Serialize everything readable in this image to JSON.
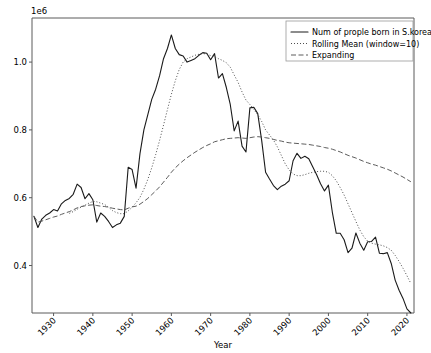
{
  "chart_data": {
    "type": "line",
    "title": "",
    "xlabel": "Year",
    "ylabel": "",
    "y_offset_text": "1e6",
    "xlim": [
      1924.5,
      2021.8
    ],
    "ylim": [
      260000,
      1130000
    ],
    "grid": false,
    "legend_position": "upper right",
    "xticks": [
      1930,
      1940,
      1950,
      1960,
      1970,
      1980,
      1990,
      2000,
      2010,
      2020
    ],
    "xtick_labels": [
      "1930",
      "1940",
      "1950",
      "1960",
      "1970",
      "1980",
      "1990",
      "2000",
      "2010",
      "2020"
    ],
    "xtick_rotation": 45,
    "yticks": [
      400000,
      600000,
      800000,
      1000000
    ],
    "ytick_labels": [
      "0.4",
      "0.6",
      "0.8",
      "1.0"
    ],
    "x": [
      1925,
      1926,
      1927,
      1928,
      1929,
      1930,
      1931,
      1932,
      1933,
      1934,
      1935,
      1936,
      1937,
      1938,
      1939,
      1940,
      1941,
      1942,
      1943,
      1944,
      1945,
      1946,
      1947,
      1948,
      1949,
      1950,
      1951,
      1952,
      1953,
      1954,
      1955,
      1956,
      1957,
      1958,
      1959,
      1960,
      1961,
      1962,
      1963,
      1964,
      1965,
      1966,
      1967,
      1968,
      1969,
      1970,
      1971,
      1972,
      1973,
      1974,
      1975,
      1976,
      1977,
      1978,
      1979,
      1980,
      1981,
      1982,
      1983,
      1984,
      1985,
      1986,
      1987,
      1988,
      1989,
      1990,
      1991,
      1992,
      1993,
      1994,
      1995,
      1996,
      1997,
      1998,
      1999,
      2000,
      2001,
      2002,
      2003,
      2004,
      2005,
      2006,
      2007,
      2008,
      2009,
      2010,
      2011,
      2012,
      2013,
      2014,
      2015,
      2016,
      2017,
      2018,
      2019,
      2020,
      2021
    ],
    "series": [
      {
        "name": "Num of prople born in S.korea",
        "style": "solid",
        "color": "#1a1a1a",
        "values": [
          545000,
          512000,
          537000,
          548000,
          555000,
          565000,
          561000,
          582000,
          592000,
          598000,
          610000,
          640000,
          630000,
          597000,
          612000,
          594000,
          528000,
          555000,
          545000,
          530000,
          512000,
          520000,
          525000,
          545000,
          690000,
          683000,
          628000,
          730000,
          800000,
          845000,
          890000,
          920000,
          960000,
          1010000,
          1040000,
          1080000,
          1040000,
          1022000,
          1018000,
          1000000,
          1005000,
          1010000,
          1020000,
          1028000,
          1026000,
          1007000,
          1025000,
          953000,
          966000,
          925000,
          875000,
          797000,
          826000,
          752000,
          735000,
          865000,
          867000,
          848000,
          769000,
          675000,
          655000,
          636000,
          624000,
          634000,
          640000,
          650000,
          709000,
          731000,
          716000,
          722000,
          715000,
          691000,
          668000,
          641000,
          620000,
          637000,
          557000,
          495000,
          495000,
          476000,
          438000,
          451000,
          496000,
          466000,
          445000,
          470000,
          471000,
          484000,
          436000,
          435000,
          438000,
          406000,
          357000,
          327000,
          303000,
          272000,
          260000
        ]
      },
      {
        "name": "Rolling Mean (window=10)",
        "style": "dotted",
        "color": "#3a3a3a",
        "values": [
          null,
          null,
          null,
          null,
          null,
          null,
          null,
          null,
          null,
          554000,
          559000,
          566000,
          572000,
          578000,
          584000,
          589000,
          588000,
          584000,
          580000,
          572000,
          562000,
          556000,
          553000,
          553000,
          561000,
          572000,
          585000,
          601000,
          625000,
          654000,
          688000,
          727000,
          769000,
          814000,
          860000,
          905000,
          945000,
          978000,
          1000000,
          1010000,
          1015000,
          1020000,
          1023000,
          1025000,
          1024000,
          1019000,
          1016000,
          1010000,
          1005000,
          998000,
          985000,
          962000,
          940000,
          912000,
          888000,
          875000,
          860000,
          845000,
          825000,
          800000,
          785000,
          770000,
          750000,
          725000,
          700000,
          682000,
          670000,
          665000,
          665000,
          668000,
          672000,
          675000,
          677000,
          678000,
          678000,
          675000,
          665000,
          650000,
          630000,
          608000,
          582000,
          556000,
          530000,
          505000,
          485000,
          472000,
          466000,
          463000,
          461000,
          458000,
          453000,
          445000,
          430000,
          412000,
          392000,
          370000,
          347000
        ]
      },
      {
        "name": "Expanding",
        "style": "dashed",
        "color": "#4a4a4a",
        "values": [
          545000,
          528000,
          531000,
          535000,
          539000,
          543000,
          546000,
          551000,
          555000,
          559000,
          564000,
          570000,
          574000,
          576000,
          578000,
          579000,
          577000,
          575000,
          574000,
          572000,
          569000,
          567000,
          565000,
          564000,
          569000,
          573000,
          575000,
          581000,
          589000,
          598000,
          609000,
          620000,
          632000,
          646000,
          660000,
          675000,
          688000,
          699000,
          709000,
          718000,
          726000,
          734000,
          741000,
          748000,
          754000,
          759000,
          765000,
          768000,
          771000,
          774000,
          775000,
          776000,
          777000,
          776000,
          775000,
          777000,
          779000,
          780000,
          779000,
          777000,
          775000,
          772000,
          769000,
          767000,
          764000,
          762000,
          761000,
          760000,
          759000,
          758000,
          757000,
          755000,
          753000,
          751000,
          748000,
          746000,
          743000,
          739000,
          735000,
          730000,
          725000,
          721000,
          717000,
          712000,
          707000,
          703000,
          699000,
          696000,
          692000,
          688000,
          684000,
          679000,
          673000,
          667000,
          661000,
          654000,
          647000
        ]
      }
    ]
  },
  "legend": {
    "items": [
      {
        "label": "Num of prople born in S.korea",
        "style": "solid"
      },
      {
        "label": "Rolling Mean (window=10)",
        "style": "dotted"
      },
      {
        "label": "Expanding",
        "style": "dashed"
      }
    ]
  },
  "colors": {
    "background": "#ffffff",
    "spine": "#5a5a5a",
    "text": "#000000",
    "series_solid": "#1a1a1a",
    "series_dotted": "#3a3a3a",
    "series_dashed": "#4a4a4a",
    "legend_border": "#9a9a9a"
  }
}
